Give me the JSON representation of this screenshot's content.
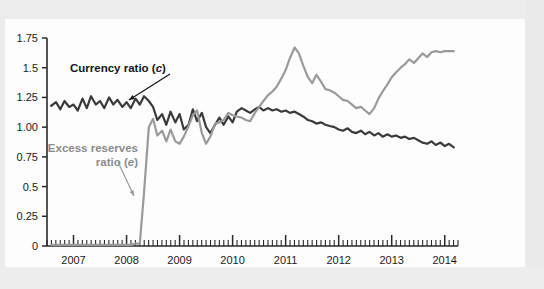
{
  "figure": {
    "name": "currency-and-excess-reserve-ratios-chart",
    "background_color": "#ffffff",
    "sheet_color": "#fdfdfd",
    "page_band_color": "#ededed"
  },
  "chart_data": {
    "type": "line",
    "title": "",
    "subtitle": "",
    "xlabel": "",
    "ylabel": "",
    "xlim": [
      2006.5,
      2014.25
    ],
    "ylim": [
      0,
      1.75
    ],
    "grid": false,
    "legend_position": "inline-annotation",
    "y_ticks": [
      "0",
      "0.25",
      "0.5",
      "0.75",
      "1.00",
      "1.25",
      "1.5",
      "1.75"
    ],
    "y_tick_values": [
      0,
      0.25,
      0.5,
      0.75,
      1.0,
      1.25,
      1.5,
      1.75
    ],
    "x_ticks": [
      "2007",
      "2008",
      "2009",
      "2010",
      "2011",
      "2012",
      "2013",
      "2014"
    ],
    "x_tick_values": [
      2007,
      2008,
      2009,
      2010,
      2011,
      2012,
      2013,
      2014
    ],
    "x_minor_tick_interval_months": 1,
    "series": [
      {
        "name": "Currency ratio (c)",
        "label_plain": "Currency ratio (",
        "label_italic": "c",
        "label_close": ")",
        "color": "#3a3a3a",
        "line_width": 2.2,
        "x": [
          2006.58,
          2006.67,
          2006.75,
          2006.83,
          2006.92,
          2007.0,
          2007.08,
          2007.17,
          2007.25,
          2007.33,
          2007.42,
          2007.5,
          2007.58,
          2007.67,
          2007.75,
          2007.83,
          2007.92,
          2008.0,
          2008.08,
          2008.17,
          2008.25,
          2008.33,
          2008.42,
          2008.5,
          2008.58,
          2008.67,
          2008.75,
          2008.83,
          2008.92,
          2009.0,
          2009.08,
          2009.17,
          2009.25,
          2009.33,
          2009.42,
          2009.5,
          2009.58,
          2009.67,
          2009.75,
          2009.83,
          2009.92,
          2010.0,
          2010.08,
          2010.17,
          2010.25,
          2010.33,
          2010.42,
          2010.5,
          2010.58,
          2010.67,
          2010.75,
          2010.83,
          2010.92,
          2011.0,
          2011.08,
          2011.17,
          2011.25,
          2011.33,
          2011.42,
          2011.5,
          2011.58,
          2011.67,
          2011.75,
          2011.83,
          2011.92,
          2012.0,
          2012.08,
          2012.17,
          2012.25,
          2012.33,
          2012.42,
          2012.5,
          2012.58,
          2012.67,
          2012.75,
          2012.83,
          2012.92,
          2013.0,
          2013.08,
          2013.17,
          2013.25,
          2013.33,
          2013.42,
          2013.5,
          2013.58,
          2013.67,
          2013.75,
          2013.83,
          2013.92,
          2014.0,
          2014.08,
          2014.17
        ],
        "values": [
          1.18,
          1.21,
          1.15,
          1.22,
          1.17,
          1.19,
          1.14,
          1.24,
          1.16,
          1.26,
          1.19,
          1.22,
          1.16,
          1.25,
          1.19,
          1.23,
          1.17,
          1.21,
          1.16,
          1.24,
          1.19,
          1.26,
          1.22,
          1.17,
          1.06,
          1.11,
          1.02,
          1.13,
          1.04,
          1.11,
          0.98,
          1.02,
          1.15,
          1.05,
          1.12,
          1.0,
          0.95,
          1.02,
          1.08,
          1.02,
          1.09,
          1.04,
          1.13,
          1.16,
          1.14,
          1.12,
          1.15,
          1.17,
          1.14,
          1.16,
          1.14,
          1.15,
          1.13,
          1.14,
          1.12,
          1.13,
          1.11,
          1.09,
          1.06,
          1.05,
          1.03,
          1.04,
          1.02,
          1.01,
          1.0,
          0.98,
          0.97,
          0.99,
          0.96,
          0.95,
          0.97,
          0.94,
          0.96,
          0.93,
          0.95,
          0.92,
          0.94,
          0.92,
          0.93,
          0.91,
          0.92,
          0.9,
          0.91,
          0.89,
          0.87,
          0.86,
          0.88,
          0.85,
          0.87,
          0.84,
          0.86,
          0.83
        ],
        "annotation": {
          "text": "Currency ratio (c)",
          "arrow_from_x": 170,
          "arrow_from_y": 74,
          "arrow_to_x": 129,
          "arrow_to_y": 100
        }
      },
      {
        "name": "Excess reserves ratio (e)",
        "label_line1": "Excess reserves",
        "label_line2_plain": "ratio (",
        "label_line2_italic": "e",
        "label_close": ")",
        "color": "#9a9a9a",
        "line_width": 2.2,
        "x": [
          2006.58,
          2006.67,
          2006.75,
          2006.83,
          2006.92,
          2007.0,
          2007.08,
          2007.17,
          2007.25,
          2007.33,
          2007.42,
          2007.5,
          2007.58,
          2007.67,
          2007.75,
          2007.83,
          2007.92,
          2008.0,
          2008.08,
          2008.17,
          2008.25,
          2008.33,
          2008.42,
          2008.5,
          2008.58,
          2008.67,
          2008.75,
          2008.83,
          2008.92,
          2009.0,
          2009.08,
          2009.17,
          2009.25,
          2009.33,
          2009.42,
          2009.5,
          2009.58,
          2009.67,
          2009.75,
          2009.83,
          2009.92,
          2010.0,
          2010.08,
          2010.17,
          2010.25,
          2010.33,
          2010.42,
          2010.5,
          2010.58,
          2010.67,
          2010.75,
          2010.83,
          2010.92,
          2011.0,
          2011.08,
          2011.17,
          2011.25,
          2011.33,
          2011.42,
          2011.5,
          2011.58,
          2011.67,
          2011.75,
          2011.83,
          2011.92,
          2012.0,
          2012.08,
          2012.17,
          2012.25,
          2012.33,
          2012.42,
          2012.5,
          2012.58,
          2012.67,
          2012.75,
          2012.83,
          2012.92,
          2013.0,
          2013.08,
          2013.17,
          2013.25,
          2013.33,
          2013.42,
          2013.5,
          2013.58,
          2013.67,
          2013.75,
          2013.83,
          2013.92,
          2014.0,
          2014.08,
          2014.17
        ],
        "values": [
          0.01,
          0.01,
          0.01,
          0.01,
          0.01,
          0.01,
          0.01,
          0.01,
          0.01,
          0.01,
          0.01,
          0.01,
          0.01,
          0.01,
          0.01,
          0.01,
          0.01,
          0.01,
          0.01,
          0.02,
          0.02,
          0.45,
          1.0,
          1.07,
          0.93,
          0.97,
          0.88,
          0.98,
          0.88,
          0.86,
          0.92,
          1.01,
          1.1,
          1.14,
          0.95,
          0.86,
          0.92,
          1.03,
          1.04,
          1.06,
          1.12,
          1.1,
          1.09,
          1.08,
          1.06,
          1.05,
          1.12,
          1.17,
          1.22,
          1.27,
          1.3,
          1.34,
          1.41,
          1.48,
          1.58,
          1.67,
          1.62,
          1.52,
          1.42,
          1.37,
          1.44,
          1.38,
          1.32,
          1.31,
          1.29,
          1.26,
          1.23,
          1.22,
          1.19,
          1.16,
          1.17,
          1.14,
          1.11,
          1.16,
          1.24,
          1.3,
          1.36,
          1.42,
          1.46,
          1.5,
          1.53,
          1.57,
          1.54,
          1.58,
          1.62,
          1.59,
          1.63,
          1.64,
          1.63,
          1.64,
          1.64,
          1.64
        ],
        "annotation": {
          "text": "Excess reserves ratio (e)",
          "arrow_from_x": 118,
          "arrow_from_y": 162,
          "arrow_to_x": 134,
          "arrow_to_y": 196
        }
      }
    ]
  }
}
